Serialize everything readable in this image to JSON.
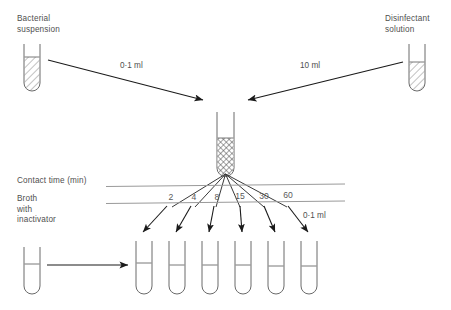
{
  "diagram": {
    "title_visible": false,
    "labels": {
      "bacterial_suspension": "Bacterial\nsuspension",
      "disinfectant_solution": "Disinfectant\nsolution",
      "contact_time": "Contact time (min)",
      "broth_with_inactivator": "Broth\nwith\ninactivator"
    },
    "volumes": {
      "bacterial_transfer": "0·1 ml",
      "disinfectant_transfer": "10 ml",
      "sample_transfer": "0·1 ml"
    },
    "contact_times": [
      "2",
      "4",
      "8",
      "15",
      "30",
      "60"
    ],
    "colors": {
      "stroke": "#555555",
      "arrow": "#1a1a1a",
      "text": "#4f4f4f",
      "rule": "#8a8a8a",
      "background": "#ffffff"
    },
    "tubes": {
      "bacterial_suspension_fill": "diagonal-hatch",
      "disinfectant_solution_fill": "diagonal-hatch",
      "mixing_tube_fill": "cross-hatch",
      "broth_source_fill": "empty",
      "sample_tube_fill": "empty",
      "sample_tube_count": 6
    }
  }
}
